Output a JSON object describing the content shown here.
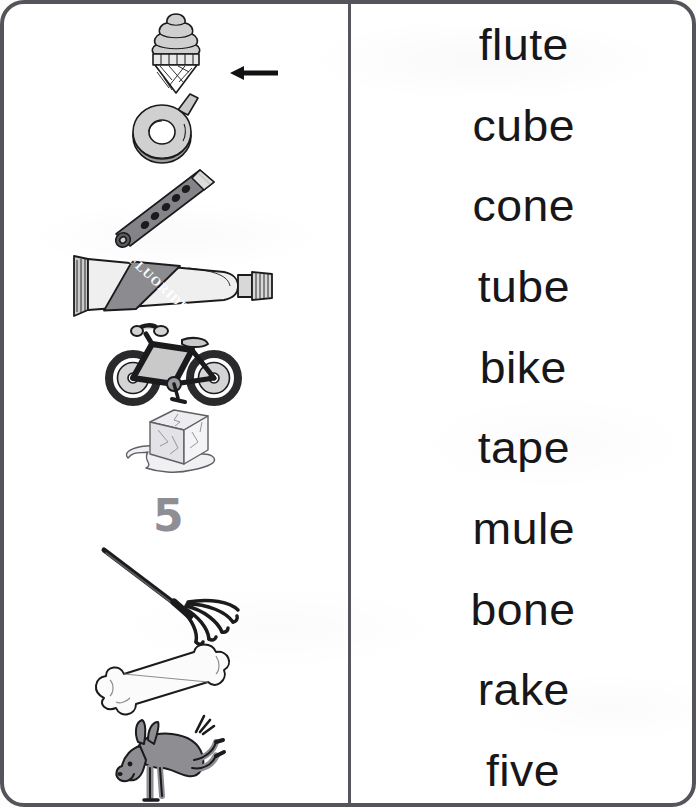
{
  "worksheet": {
    "type": "picture-word-matching",
    "instruction_example": "arrow points from the word column to the matching picture",
    "border_color": "#54545a",
    "divider_color": "#55555b",
    "text_color": "#17171a"
  },
  "pictures": {
    "column_label": "picture-column",
    "items": [
      {
        "id": "cone",
        "name": "ice-cream-cone-picture",
        "alt": "ice cream cone with swirled soft-serve on a waffle cone",
        "has_arrow": true,
        "arrow_direction": "left",
        "top": 4,
        "height": 88
      },
      {
        "id": "tape",
        "name": "tape-roll-picture",
        "alt": "roll of tape with a loose end",
        "has_arrow": false,
        "arrow_direction": "",
        "top": 84,
        "height": 84
      },
      {
        "id": "flute",
        "name": "flute-picture",
        "alt": "flute tilted diagonally with finger holes",
        "has_arrow": false,
        "arrow_direction": "",
        "top": 160,
        "height": 90
      },
      {
        "id": "tube",
        "name": "toothpaste-tube-picture",
        "alt": "toothpaste tube labelled FLUORIDE",
        "has_arrow": false,
        "arrow_direction": "",
        "top": 244,
        "height": 78
      },
      {
        "id": "bike",
        "name": "bicycle-picture",
        "alt": "bicycle seen from the side",
        "has_arrow": false,
        "arrow_direction": "",
        "top": 316,
        "height": 86
      },
      {
        "id": "cube",
        "name": "ice-cube-picture",
        "alt": "melting ice cube in a puddle",
        "has_arrow": false,
        "arrow_direction": "",
        "top": 398,
        "height": 80
      },
      {
        "id": "five",
        "name": "numeral-five-picture",
        "alt": "the numeral five",
        "has_arrow": false,
        "arrow_direction": "",
        "top": 480,
        "height": 62
      },
      {
        "id": "rake",
        "name": "rake-picture",
        "alt": "garden rake with fanned tines",
        "has_arrow": false,
        "arrow_direction": "",
        "top": 540,
        "height": 104
      },
      {
        "id": "bone",
        "name": "bone-picture",
        "alt": "dog bone tilted diagonally",
        "has_arrow": false,
        "arrow_direction": "",
        "top": 638,
        "height": 84
      },
      {
        "id": "mule",
        "name": "mule-picture",
        "alt": "grey mule bucking its hind legs",
        "has_arrow": false,
        "arrow_direction": "",
        "top": 708,
        "height": 96
      }
    ],
    "tube_label": "FLUORIDE",
    "numeral": "5"
  },
  "words": {
    "column_label": "word-column",
    "items": [
      {
        "text": "flute"
      },
      {
        "text": "cube"
      },
      {
        "text": "cone"
      },
      {
        "text": "tube"
      },
      {
        "text": "bike"
      },
      {
        "text": "tape"
      },
      {
        "text": "mule"
      },
      {
        "text": "bone"
      },
      {
        "text": "rake"
      },
      {
        "text": "five"
      }
    ]
  },
  "colors": {
    "ink": "#1b1b1e",
    "light_gray": "#d6d6d6",
    "mid_gray": "#a9a9ad",
    "dark_gray": "#6e6e73",
    "tire": "#2a2a2d",
    "mule_body": "#8e8e92",
    "numeral_gray": "#8e8e94"
  }
}
